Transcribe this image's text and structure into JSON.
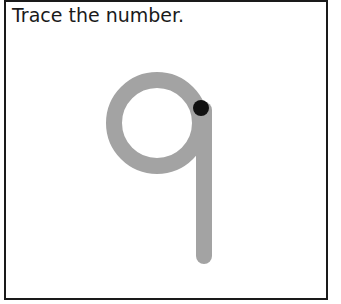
{
  "worksheet": {
    "instruction": "Trace the number.",
    "digit": "9",
    "colors": {
      "border": "#1a1a1a",
      "trace_path": "#a3a3a3",
      "start_dot": "#111111"
    }
  }
}
